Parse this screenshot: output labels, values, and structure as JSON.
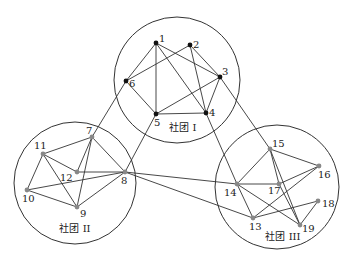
{
  "diagram": {
    "title": "",
    "communities": [
      {
        "id": "I",
        "label": "社团 I",
        "cx": 177,
        "cy": 80,
        "r": 63,
        "label_x": 183,
        "label_y": 131
      },
      {
        "id": "II",
        "label": "社团 II",
        "cx": 75,
        "cy": 183,
        "r": 61,
        "label_x": 75,
        "label_y": 232
      },
      {
        "id": "III",
        "label": "社团 III",
        "cx": 277,
        "cy": 187,
        "r": 62,
        "label_x": 283,
        "label_y": 240
      }
    ],
    "nodes": [
      {
        "id": "1",
        "x": 156,
        "y": 43,
        "community": "I",
        "lx": 159,
        "ly": 42,
        "color": "#111111"
      },
      {
        "id": "2",
        "x": 190,
        "y": 45,
        "community": "I",
        "lx": 193,
        "ly": 48,
        "color": "#111111"
      },
      {
        "id": "3",
        "x": 220,
        "y": 77,
        "community": "I",
        "lx": 222,
        "ly": 75,
        "color": "#111111"
      },
      {
        "id": "4",
        "x": 206,
        "y": 113,
        "community": "I",
        "lx": 209,
        "ly": 116,
        "color": "#111111"
      },
      {
        "id": "5",
        "x": 156,
        "y": 114,
        "community": "I",
        "lx": 154,
        "ly": 126,
        "color": "#111111"
      },
      {
        "id": "6",
        "x": 126,
        "y": 81,
        "community": "I",
        "lx": 129,
        "ly": 87,
        "color": "#111111"
      },
      {
        "id": "7",
        "x": 92,
        "y": 137,
        "community": "II",
        "lx": 86,
        "ly": 134,
        "color": "#888888"
      },
      {
        "id": "8",
        "x": 125,
        "y": 172,
        "community": "II",
        "lx": 121,
        "ly": 184,
        "color": "#888888"
      },
      {
        "id": "9",
        "x": 77,
        "y": 207,
        "community": "II",
        "lx": 80,
        "ly": 217,
        "color": "#888888"
      },
      {
        "id": "10",
        "x": 27,
        "y": 190,
        "community": "II",
        "lx": 22,
        "ly": 202,
        "color": "#888888"
      },
      {
        "id": "11",
        "x": 43,
        "y": 154,
        "community": "II",
        "lx": 34,
        "ly": 149,
        "color": "#888888"
      },
      {
        "id": "12",
        "x": 77,
        "y": 172,
        "community": "II",
        "lx": 60,
        "ly": 181,
        "color": "#888888"
      },
      {
        "id": "13",
        "x": 253,
        "y": 218,
        "community": "III",
        "lx": 249,
        "ly": 230,
        "color": "#888888"
      },
      {
        "id": "14",
        "x": 237,
        "y": 184,
        "community": "III",
        "lx": 224,
        "ly": 196,
        "color": "#888888"
      },
      {
        "id": "15",
        "x": 270,
        "y": 149,
        "community": "III",
        "lx": 272,
        "ly": 147,
        "color": "#888888"
      },
      {
        "id": "16",
        "x": 319,
        "y": 166,
        "community": "III",
        "lx": 318,
        "ly": 178,
        "color": "#888888"
      },
      {
        "id": "17",
        "x": 279,
        "y": 184,
        "community": "III",
        "lx": 268,
        "ly": 194,
        "color": "#888888"
      },
      {
        "id": "18",
        "x": 318,
        "y": 201,
        "community": "III",
        "lx": 322,
        "ly": 207,
        "color": "#888888"
      },
      {
        "id": "19",
        "x": 300,
        "y": 225,
        "community": "III",
        "lx": 302,
        "ly": 232,
        "color": "#888888"
      }
    ],
    "edges": [
      [
        "1",
        "6"
      ],
      [
        "1",
        "5"
      ],
      [
        "1",
        "4"
      ],
      [
        "1",
        "3"
      ],
      [
        "2",
        "6"
      ],
      [
        "2",
        "4"
      ],
      [
        "2",
        "3"
      ],
      [
        "3",
        "5"
      ],
      [
        "3",
        "4"
      ],
      [
        "4",
        "5"
      ],
      [
        "5",
        "6"
      ],
      [
        "7",
        "11"
      ],
      [
        "7",
        "12"
      ],
      [
        "7",
        "9"
      ],
      [
        "7",
        "8"
      ],
      [
        "11",
        "10"
      ],
      [
        "11",
        "12"
      ],
      [
        "11",
        "9"
      ],
      [
        "10",
        "9"
      ],
      [
        "10",
        "8"
      ],
      [
        "12",
        "8"
      ],
      [
        "9",
        "8"
      ],
      [
        "15",
        "14"
      ],
      [
        "15",
        "16"
      ],
      [
        "15",
        "17"
      ],
      [
        "15",
        "19"
      ],
      [
        "14",
        "17"
      ],
      [
        "14",
        "13"
      ],
      [
        "14",
        "19"
      ],
      [
        "17",
        "16"
      ],
      [
        "17",
        "19"
      ],
      [
        "13",
        "16"
      ],
      [
        "13",
        "18"
      ],
      [
        "18",
        "19"
      ],
      [
        "6",
        "7"
      ],
      [
        "5",
        "8"
      ],
      [
        "3",
        "15"
      ],
      [
        "4",
        "14"
      ],
      [
        "8",
        "14"
      ],
      [
        "8",
        "13"
      ]
    ]
  }
}
